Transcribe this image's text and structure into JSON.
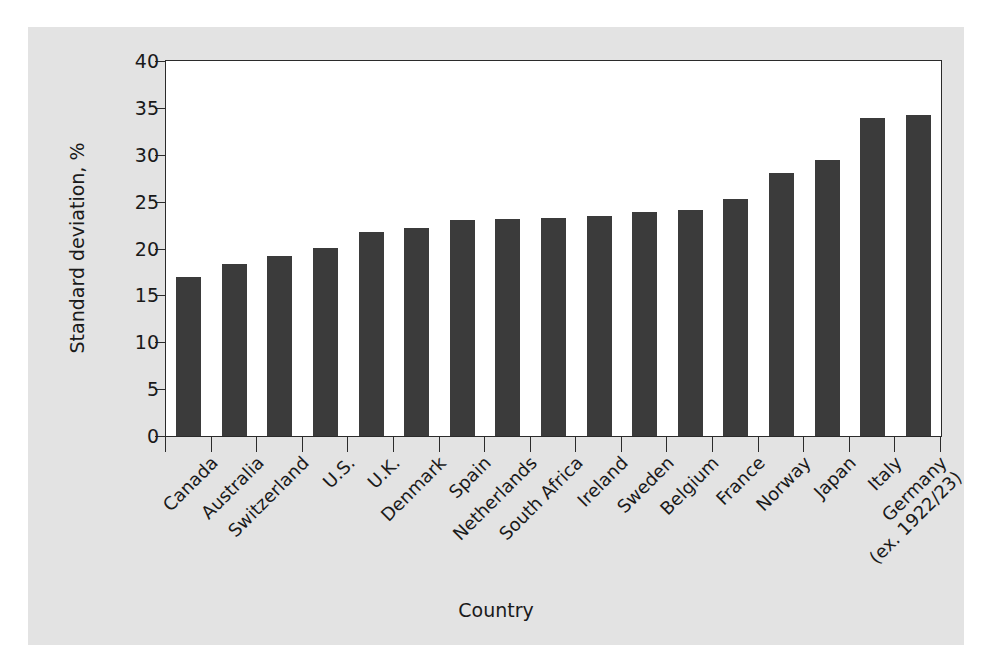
{
  "chart_data": {
    "type": "bar",
    "title": "",
    "xlabel": "Country",
    "ylabel": "Standard deviation, %",
    "ylim": [
      0,
      40
    ],
    "ytick_values": [
      0,
      5,
      10,
      15,
      20,
      25,
      30,
      35,
      40
    ],
    "ytick_labels": [
      "0",
      "5",
      "10",
      "15",
      "20",
      "25",
      "30",
      "35",
      "40"
    ],
    "grid": false,
    "legend": null,
    "bar_color": "#3b3b3b",
    "plot_background": "#ffffff",
    "figure_background": "#e3e3e3",
    "axis_color": "#2b2b2b",
    "categories": [
      "Canada",
      "Australia",
      "Switzerland",
      "U.S.",
      "U.K.",
      "Denmark",
      "Spain",
      "Netherlands",
      "South Africa",
      "Ireland",
      "Sweden",
      "Belgium",
      "France",
      "Norway",
      "Japan",
      "Italy",
      "Germany"
    ],
    "category_label_lines": [
      [
        "Canada"
      ],
      [
        "Australia"
      ],
      [
        "Switzerland"
      ],
      [
        "U.S."
      ],
      [
        "U.K."
      ],
      [
        "Denmark"
      ],
      [
        "Spain"
      ],
      [
        "Netherlands"
      ],
      [
        "South Africa"
      ],
      [
        "Ireland"
      ],
      [
        "Sweden"
      ],
      [
        "Belgium"
      ],
      [
        "France"
      ],
      [
        "Norway"
      ],
      [
        "Japan"
      ],
      [
        "Italy"
      ],
      [
        "Germany",
        "(ex. 1922/23)"
      ]
    ],
    "values": [
      17.0,
      18.4,
      19.2,
      20.1,
      21.8,
      22.2,
      23.0,
      23.2,
      23.3,
      23.5,
      23.9,
      24.1,
      25.3,
      28.1,
      29.4,
      33.9,
      34.2
    ]
  }
}
